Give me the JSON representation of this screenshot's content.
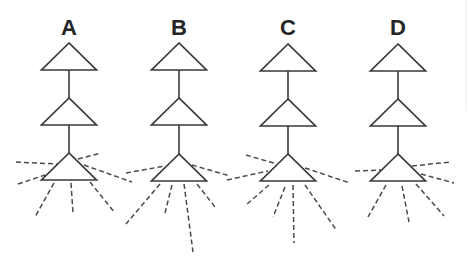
{
  "figure": {
    "panels": [
      {
        "label": "A",
        "cx": 69,
        "label_y": 35,
        "triangle_apex_y": [
          43,
          98,
          153
        ],
        "dashed_lines": [
          [
            16,
            162,
            57,
            164
          ],
          [
            18,
            184,
            45,
            175
          ],
          [
            78,
            159,
            101,
            153
          ],
          [
            84,
            165,
            132,
            182
          ],
          [
            54,
            183,
            35,
            217
          ],
          [
            71,
            183,
            73,
            213
          ],
          [
            90,
            182,
            115,
            213
          ]
        ]
      },
      {
        "label": "B",
        "cx": 179,
        "label_y": 35,
        "triangle_apex_y": [
          43,
          98,
          154
        ],
        "dashed_lines": [
          [
            126,
            173,
            165,
            166
          ],
          [
            192,
            165,
            230,
            176
          ],
          [
            160,
            184,
            126,
            224
          ],
          [
            172,
            185,
            165,
            213
          ],
          [
            184,
            184,
            193,
            252
          ],
          [
            197,
            184,
            215,
            207
          ]
        ]
      },
      {
        "label": "C",
        "cx": 288,
        "label_y": 35,
        "triangle_apex_y": [
          44,
          99,
          154
        ],
        "dashed_lines": [
          [
            246,
            155,
            277,
            164
          ],
          [
            227,
            180,
            268,
            171
          ],
          [
            305,
            168,
            350,
            183
          ],
          [
            269,
            185,
            246,
            205
          ],
          [
            285,
            187,
            273,
            217
          ],
          [
            293,
            185,
            294,
            243
          ],
          [
            305,
            185,
            337,
            231
          ]
        ]
      },
      {
        "label": "D",
        "cx": 398,
        "label_y": 35,
        "triangle_apex_y": [
          44,
          99,
          154
        ],
        "dashed_lines": [
          [
            355,
            171,
            381,
            170
          ],
          [
            412,
            166,
            451,
            162
          ],
          [
            421,
            174,
            454,
            183
          ],
          [
            386,
            185,
            368,
            217
          ],
          [
            402,
            186,
            409,
            222
          ],
          [
            416,
            184,
            444,
            216
          ]
        ]
      }
    ],
    "triangle": {
      "half_width": 27.5,
      "height": 27
    },
    "colors": {
      "stroke": "#3a3a3a",
      "label": "#252525",
      "background": "#ffffff"
    }
  }
}
